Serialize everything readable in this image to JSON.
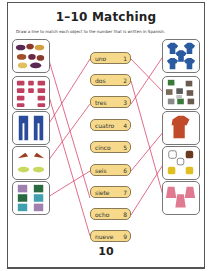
{
  "worksheet": {
    "title": "1–10 Matching",
    "instructions": "Draw a line to match each object to the number that is written in Spanish.",
    "page_number": "10"
  },
  "words": [
    {
      "word": "uno",
      "number": "1"
    },
    {
      "word": "dos",
      "number": "2"
    },
    {
      "word": "tres",
      "number": "3"
    },
    {
      "word": "cuatro",
      "number": "4"
    },
    {
      "word": "cinco",
      "number": "5"
    },
    {
      "word": "seis",
      "number": "6"
    },
    {
      "word": "siete",
      "number": "7"
    },
    {
      "word": "ocho",
      "number": "8"
    },
    {
      "word": "nueve",
      "number": "9"
    },
    {
      "word": "diez",
      "number": "10"
    }
  ],
  "left_pictures": [
    {
      "name": "hats",
      "count": 8
    },
    {
      "name": "bows",
      "count": 10
    },
    {
      "name": "pants",
      "count": 2
    },
    {
      "name": "shoes",
      "count": 4
    },
    {
      "name": "shorts",
      "count": 6
    }
  ],
  "right_pictures": [
    {
      "name": "blue-shirts",
      "count": 5
    },
    {
      "name": "t-shirts",
      "count": 9
    },
    {
      "name": "jacket",
      "count": 1
    },
    {
      "name": "gloves",
      "count": 7
    },
    {
      "name": "dresses",
      "count": 3
    }
  ],
  "colors": {
    "word_fill": "#f6d98a",
    "word_border": "#8a7a55",
    "line": "#d9486e",
    "box_border": "#777777"
  }
}
